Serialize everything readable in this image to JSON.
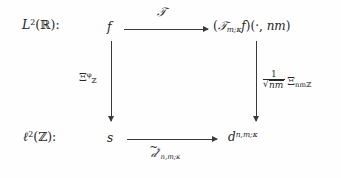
{
  "diagram": {
    "type": "commutative-diagram",
    "kind": "square",
    "background_color": "#fefefe",
    "ink_color": "#262626",
    "row_labels": {
      "top": "L²(ℝ):",
      "bottom": "ℓ²(ℤ):"
    },
    "nodes": {
      "top_left": "f",
      "top_right": "(𝒯m;κ f)(·, nm)",
      "bottom_left": "s",
      "bottom_right": "d^{n,m;κ}"
    },
    "node_parts": {
      "top_left": {
        "base": "f"
      },
      "bottom_left": {
        "base": "s"
      },
      "top_right": {
        "open": "(",
        "operator": "𝒯",
        "operator_sub": "m;κ",
        "argument": "f",
        "close_group": ")(",
        "dot": "·",
        "comma": ", ",
        "second_arg": "nm",
        "close": ")"
      },
      "bottom_right": {
        "base": "d",
        "sup": "n,m;κ"
      }
    },
    "arrows": [
      {
        "name": "top-arrow",
        "from": "f",
        "to": "(𝒯m;κ f)(·, nm)",
        "direction": "right",
        "label": "𝒯",
        "label_position": "above"
      },
      {
        "name": "left-arrow",
        "from": "f",
        "to": "s",
        "direction": "down",
        "label_base": "Ξ",
        "label_sub": "ℤ",
        "label_sup": "φ",
        "label_position": "left"
      },
      {
        "name": "right-arrow",
        "from": "(𝒯m;κ f)(·, nm)",
        "to": "d^{n,m;κ}",
        "direction": "down",
        "label_numerator": "1",
        "label_radicand": "nm",
        "label_base": "Ξ",
        "label_sub": "nmℤ",
        "label_position": "right"
      },
      {
        "name": "bottom-arrow",
        "from": "s",
        "to": "d^{n,m;κ}",
        "direction": "right",
        "label_base": "𝒹",
        "label_accent": "̃",
        "label_sup": "*",
        "label_sub": "n,m;κ",
        "label_position": "below"
      }
    ]
  }
}
